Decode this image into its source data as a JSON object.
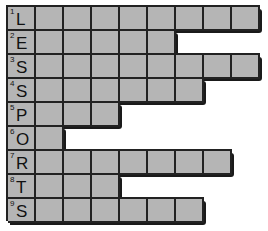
{
  "puzzle": {
    "columns": 9,
    "cell_color": "#b5b5b5",
    "line_color": "#222222",
    "rows": [
      {
        "number": "1",
        "letter": "L",
        "length": 9
      },
      {
        "number": "2",
        "letter": "E",
        "length": 6
      },
      {
        "number": "3",
        "letter": "S",
        "length": 9
      },
      {
        "number": "4",
        "letter": "S",
        "length": 7
      },
      {
        "number": "5",
        "letter": "P",
        "length": 4
      },
      {
        "number": "6",
        "letter": "O",
        "length": 2
      },
      {
        "number": "7",
        "letter": "R",
        "length": 8
      },
      {
        "number": "8",
        "letter": "T",
        "length": 4
      },
      {
        "number": "9",
        "letter": "S",
        "length": 7
      }
    ],
    "vertical_word": "LESSPORTS"
  }
}
